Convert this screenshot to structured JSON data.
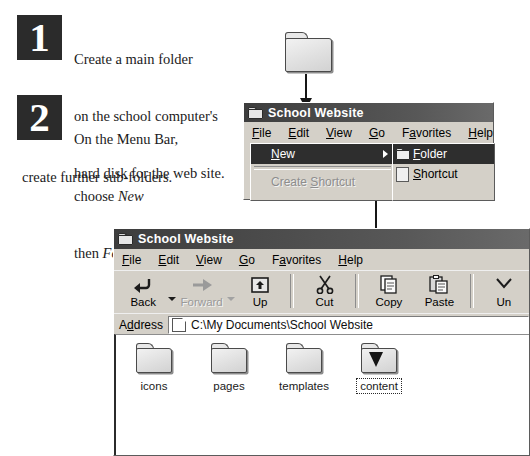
{
  "steps": [
    {
      "number": "1",
      "lines": [
        "Create a main folder",
        "on the school computer's",
        "hard disk for the web site."
      ]
    },
    {
      "number": "2",
      "lines_indented": [
        "On the Menu Bar,",
        "choose New",
        "then Folder to"
      ],
      "line_full": "create further sub-folders.",
      "italic_words": [
        "New",
        "Folder"
      ]
    }
  ],
  "step1": {
    "line1": "Create a main folder",
    "line2": "on the school computer's",
    "line3": "hard disk for the web site."
  },
  "step2": {
    "line1": "On the Menu Bar,",
    "line2_pre": "choose ",
    "line2_em": "New",
    "line3_pre": "then ",
    "line3_em": "Folder",
    "line3_post": " to",
    "line4": "create further sub-folders."
  },
  "menu_window": {
    "title": "School Website",
    "menubar": [
      {
        "accel": "F",
        "rest": "ile"
      },
      {
        "accel": "E",
        "rest": "dit"
      },
      {
        "accel": "V",
        "rest": "iew"
      },
      {
        "accel": "G",
        "rest": "o"
      },
      {
        "pre": "F",
        "accel": "a",
        "rest": "vorites"
      },
      {
        "accel": "H",
        "rest": "elp"
      }
    ],
    "dropdown": [
      {
        "accel": "N",
        "rest": "ew",
        "highlighted": true,
        "has_submenu": true
      },
      {
        "label_pre": "Create ",
        "accel": "S",
        "rest": "hortcut",
        "disabled": true
      }
    ],
    "submenu": [
      {
        "accel": "F",
        "rest": "older",
        "highlighted": true,
        "icon": "folder-icon"
      },
      {
        "accel": "S",
        "rest": "hortcut",
        "highlighted": false,
        "icon": "shortcut-document-icon"
      }
    ]
  },
  "explorer_window": {
    "title": "School Website",
    "menubar": [
      {
        "accel": "F",
        "rest": "ile"
      },
      {
        "accel": "E",
        "rest": "dit"
      },
      {
        "accel": "V",
        "rest": "iew"
      },
      {
        "accel": "G",
        "rest": "o"
      },
      {
        "pre": "F",
        "accel": "a",
        "rest": "vorites"
      },
      {
        "accel": "H",
        "rest": "elp"
      }
    ],
    "toolbar": [
      {
        "label": "Back",
        "icon": "back-arrow-icon",
        "disabled": false,
        "dropdown": true
      },
      {
        "label": "Forward",
        "icon": "forward-arrow-icon",
        "disabled": true,
        "dropdown": true
      },
      {
        "label": "Up",
        "icon": "up-folder-icon",
        "disabled": false
      },
      {
        "label": "Cut",
        "icon": "scissors-icon",
        "disabled": false
      },
      {
        "label": "Copy",
        "icon": "copy-pages-icon",
        "disabled": false
      },
      {
        "label": "Paste",
        "icon": "clipboard-paste-icon",
        "disabled": false
      },
      {
        "label": "Un",
        "icon": "undo-icon",
        "disabled": false,
        "clipped": true
      }
    ],
    "address": {
      "label_pre": "A",
      "label_accel": "d",
      "label_rest": "dress",
      "value": "C:\\My Documents\\School Website",
      "icon": "folder-small-icon"
    },
    "files": [
      {
        "label": "icons",
        "selected": false
      },
      {
        "label": "pages",
        "selected": false
      },
      {
        "label": "templates",
        "selected": false
      },
      {
        "label": "content",
        "selected": true
      }
    ]
  },
  "callouts": {
    "top_folder_icon": "folder-icon",
    "arrow_top": "arrow-down-to-titlebar",
    "arrow_long": "arrow-down-to-content-folder"
  },
  "colors": {
    "badge_bg": "#2b2b2b",
    "badge_fg": "#ffffff",
    "window_face": "#d4d0c8",
    "titlebar": "#4c4c4c",
    "menu_highlight": "#2e2e2e",
    "page_bg": "#ffffff"
  }
}
